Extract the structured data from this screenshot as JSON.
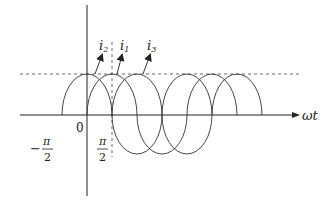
{
  "diagram": {
    "title": "",
    "x_axis_label": "ωt",
    "origin_label": "0",
    "tick_labels": [
      {
        "name": "minus-pi-over-2",
        "sign": "−",
        "numerator": "π",
        "denominator": "2"
      },
      {
        "name": "pi-over-2",
        "sign": "",
        "numerator": "π",
        "denominator": "2"
      }
    ],
    "curves": [
      {
        "name": "i2",
        "label_main": "i",
        "label_sub": "2"
      },
      {
        "name": "i1",
        "label_main": "i",
        "label_sub": "1"
      },
      {
        "name": "i3",
        "label_main": "i",
        "label_sub": "3"
      }
    ],
    "amplitude_reference_line": "dashed",
    "colors": {
      "stroke": "#333333",
      "background": "#ffffff"
    }
  }
}
